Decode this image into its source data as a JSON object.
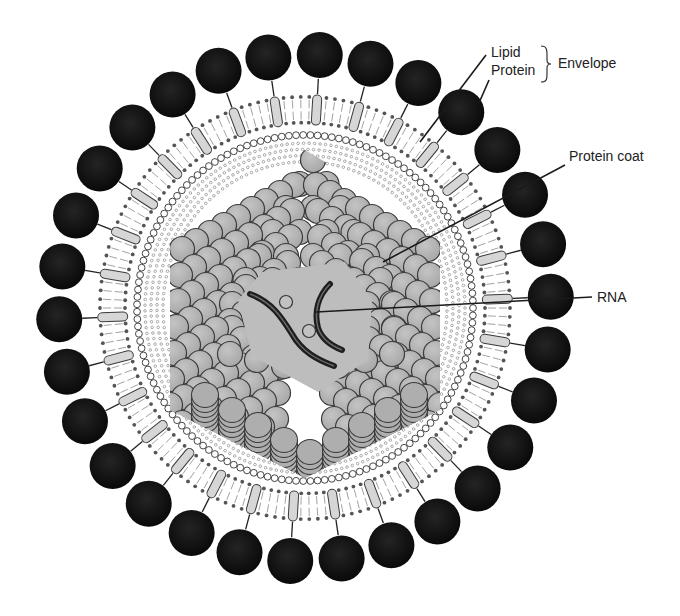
{
  "diagram": {
    "center": {
      "x": 305,
      "y": 308
    },
    "colors": {
      "background": "#ffffff",
      "glycoprotein_spike": "#111111",
      "spike_stalk": "#d6d6d6",
      "lipid_head": "#555555",
      "capsomer": "#b4b4b4",
      "capsomer_outline": "#3a3a3a",
      "rna": "#1e1e1e",
      "interior": "#bdbdbd"
    },
    "layers": {
      "spike_count": 30,
      "spike_ring_radius": 246,
      "spike_radius": 23,
      "outer_lipid_radius": 205,
      "inner_lipid_radius": 180,
      "bead_ring_radius": 168,
      "capsid_radius": 140
    },
    "labels": {
      "lipid": "Lipid",
      "protein": "Protein",
      "envelope": "Envelope",
      "protein_coat": "Protein coat",
      "rna": "RNA"
    }
  }
}
